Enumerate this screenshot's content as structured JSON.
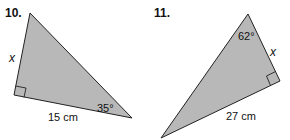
{
  "problems": [
    {
      "number": "10.",
      "side_label": "x",
      "base_label": "15 cm",
      "angle_label": "35°",
      "fill_color": "#b8b8b8",
      "stroke_color": "#222222"
    },
    {
      "number": "11.",
      "side_label": "x",
      "base_label": "27 cm",
      "angle_label": "62°",
      "fill_color": "#b8b8b8",
      "stroke_color": "#222222"
    }
  ]
}
